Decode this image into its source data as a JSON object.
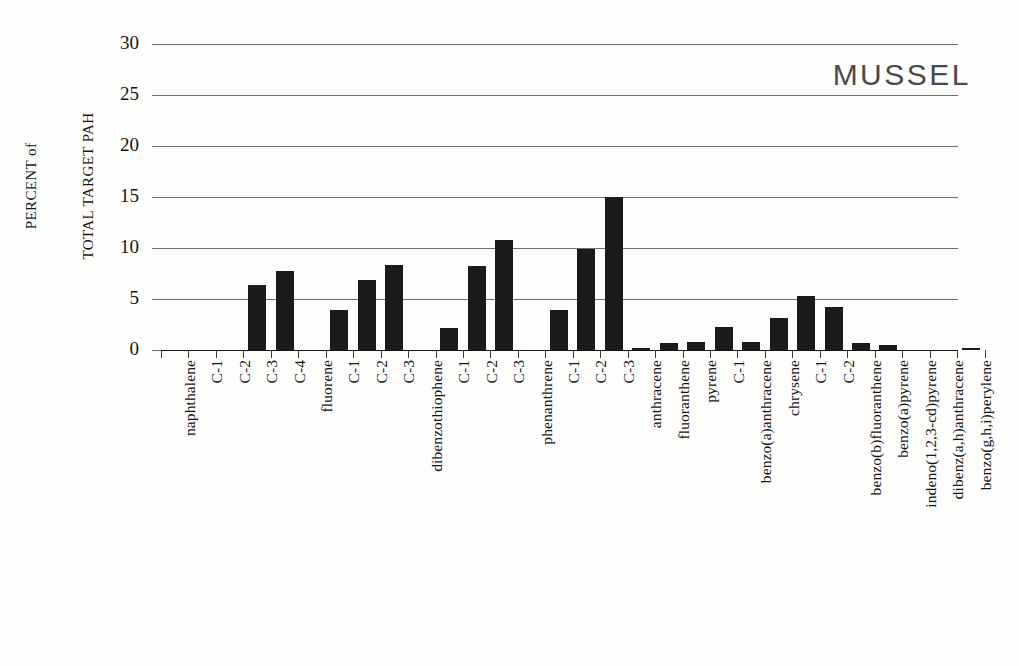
{
  "figure": {
    "series_title": "MUSSEL",
    "y_axis_title_line1": "PERCENT of",
    "y_axis_title_line2": "TOTAL TARGET PAH"
  },
  "chart_data": {
    "type": "bar",
    "title": "MUSSEL",
    "xlabel": "",
    "ylabel": "PERCENT of TOTAL TARGET PAH",
    "ylim": [
      0,
      30
    ],
    "yticks": [
      0,
      5,
      10,
      15,
      20,
      25,
      30
    ],
    "grid": true,
    "legend": "none",
    "bar_color": "#1b1b1b",
    "categories": [
      "naphthalene",
      "C-1",
      "C-2",
      "C-3",
      "C-4",
      "fluorene",
      "C-1",
      "C-2",
      "C-3",
      "dibenzothiophene",
      "C-1",
      "C-2",
      "C-3",
      "phenanthrene",
      "C-1",
      "C-2",
      "C-3",
      "anthracene",
      "fluoranthene",
      "pyrene",
      "C-1",
      "benzo(a)anthracene",
      "chrysene",
      "C-1",
      "C-2",
      "benzo(b)fluoranthene",
      "benzo(a)pyrene",
      "indeno(1,2,3-cd)pyrene",
      "dibenz(a,h)anthracene",
      "benzo(g,h,i)perylene"
    ],
    "values": [
      0.0,
      0.0,
      0.0,
      6.4,
      7.7,
      0.0,
      3.9,
      6.9,
      8.3,
      0.0,
      2.2,
      8.2,
      10.8,
      0.0,
      3.9,
      9.9,
      15.0,
      0.2,
      0.7,
      0.8,
      2.3,
      0.8,
      3.1,
      5.3,
      4.2,
      0.7,
      0.5,
      0.0,
      0.0,
      0.2
    ]
  }
}
